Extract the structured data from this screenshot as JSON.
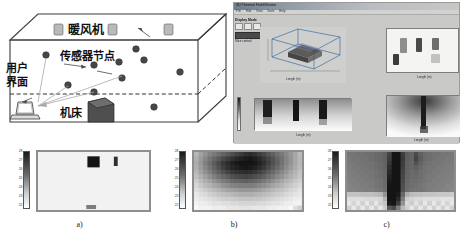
{
  "figure": {
    "panels": [
      {
        "id": "a",
        "caption": "a)"
      },
      {
        "id": "b",
        "caption": "b)"
      },
      {
        "id": "c",
        "caption": "c)"
      }
    ]
  },
  "room_diagram": {
    "labels": {
      "heater": "暖风机",
      "sensor_node": "传感器节点",
      "user_interface_line1": "用户",
      "user_interface_line2": "界面",
      "machine_tool": "机床"
    },
    "counts": {
      "heaters": 3,
      "sensor_nodes": 10,
      "machine_tools": 1,
      "user_interfaces": 1
    },
    "colors": {
      "outline": "#3a3a3a",
      "heater_fill": "#b9b9b9",
      "sensor_fill": "#4a4a4a",
      "machine_fill": "#4f4f4f"
    }
  },
  "app_window": {
    "title": "3D Thermal Field Monitor",
    "menu": [
      "File",
      "Edit",
      "View",
      "Tools",
      "Help"
    ],
    "control_panel": {
      "heading": "Display Mode",
      "boxes": [
        "X",
        "Y",
        "Z"
      ],
      "button_label": "Start monitor",
      "caption": "Slice control"
    },
    "plots": [
      {
        "name": "3d-volume-plot",
        "xlabel": "Length (m)",
        "ylabel": "Height",
        "note": "3D"
      },
      {
        "name": "top-view-plot",
        "xlabel": "Length (m)",
        "ylabel": "Width"
      },
      {
        "name": "strip-view-plot",
        "xlabel": "Length (m)"
      },
      {
        "name": "section-view-plot",
        "xlabel": "Length (m)"
      }
    ]
  },
  "chart_data": [
    {
      "type": "heatmap",
      "panel": "a",
      "title": "",
      "caption": "a)",
      "xlabel": "",
      "ylabel": "",
      "colorbar": {
        "ticks": [
          "28",
          "27",
          "26",
          "25",
          "24",
          "23",
          "22"
        ],
        "low_color": "#ffffff",
        "high_color": "#1a1a1a",
        "orientation": "vertical"
      },
      "grid": false,
      "nx": 24,
      "ny": 13,
      "description": "Near-uniform low field with two dark hot spots",
      "hotspots": [
        {
          "cx": 0.5,
          "cy": 0.17,
          "w": 0.11,
          "h": 0.19,
          "v": 28.0
        },
        {
          "cx": 0.7,
          "cy": 0.16,
          "w": 0.035,
          "h": 0.16,
          "v": 27.2
        },
        {
          "cx": 0.48,
          "cy": 0.95,
          "w": 0.09,
          "h": 0.07,
          "v": 25.0
        }
      ],
      "background_value": 22.2
    },
    {
      "type": "heatmap",
      "panel": "b",
      "title": "",
      "caption": "b)",
      "xlabel": "",
      "ylabel": "",
      "colorbar": {
        "ticks": [
          "28",
          "27",
          "26",
          "25",
          "24",
          "23",
          "22"
        ],
        "low_color": "#ffffff",
        "high_color": "#1a1a1a",
        "orientation": "vertical"
      },
      "grid": false,
      "nx": 24,
      "ny": 13,
      "description": "Pixelated diffuse plume, dark at top-centre fading to light at edges and bottom",
      "values": [
        [
          23.5,
          24.0,
          24.4,
          24.8,
          25.1,
          25.4,
          25.7,
          26.0,
          26.3,
          26.6,
          26.9,
          27.2,
          27.3,
          27.1,
          26.8,
          26.5,
          26.1,
          25.8,
          25.4,
          25.1,
          24.7,
          24.3,
          23.9,
          23.4
        ],
        [
          23.7,
          24.2,
          24.7,
          25.2,
          25.6,
          26.0,
          26.4,
          26.8,
          27.1,
          27.4,
          27.6,
          27.8,
          27.9,
          27.7,
          27.4,
          27.0,
          26.6,
          26.2,
          25.7,
          25.3,
          24.8,
          24.4,
          23.9,
          23.5
        ],
        [
          23.8,
          24.3,
          24.9,
          25.4,
          25.9,
          26.4,
          26.9,
          27.3,
          27.6,
          27.9,
          28.0,
          28.1,
          28.1,
          27.9,
          27.6,
          27.2,
          26.7,
          26.2,
          25.8,
          25.3,
          24.8,
          24.4,
          23.9,
          23.5
        ],
        [
          23.7,
          24.2,
          24.7,
          25.2,
          25.7,
          26.2,
          26.7,
          27.1,
          27.4,
          27.6,
          27.8,
          27.9,
          27.8,
          27.6,
          27.3,
          26.9,
          26.4,
          26.0,
          25.5,
          25.1,
          24.6,
          24.2,
          23.8,
          23.4
        ],
        [
          23.5,
          24.0,
          24.5,
          24.9,
          25.4,
          25.8,
          26.2,
          26.6,
          26.9,
          27.1,
          27.2,
          27.3,
          27.2,
          27.0,
          26.7,
          26.3,
          25.9,
          25.5,
          25.1,
          24.7,
          24.3,
          23.9,
          23.6,
          23.2
        ],
        [
          23.3,
          23.7,
          24.1,
          24.5,
          24.9,
          25.3,
          25.6,
          25.9,
          26.2,
          26.4,
          26.5,
          26.6,
          26.5,
          26.3,
          26.1,
          25.8,
          25.4,
          25.1,
          24.7,
          24.4,
          24.0,
          23.7,
          23.4,
          23.1
        ],
        [
          23.0,
          23.4,
          23.7,
          24.0,
          24.4,
          24.7,
          25.0,
          25.2,
          25.5,
          25.6,
          25.7,
          25.8,
          25.7,
          25.6,
          25.4,
          25.1,
          24.8,
          24.5,
          24.2,
          23.9,
          23.6,
          23.4,
          23.1,
          22.9
        ],
        [
          22.8,
          23.1,
          23.4,
          23.6,
          23.9,
          24.1,
          24.4,
          24.6,
          24.8,
          24.9,
          25.0,
          25.0,
          25.0,
          24.9,
          24.7,
          24.5,
          24.3,
          24.0,
          23.8,
          23.6,
          23.3,
          23.1,
          22.9,
          22.7
        ],
        [
          22.6,
          22.8,
          23.0,
          23.2,
          23.4,
          23.6,
          23.8,
          24.0,
          24.1,
          24.2,
          24.3,
          24.3,
          24.3,
          24.2,
          24.1,
          23.9,
          23.7,
          23.5,
          23.3,
          23.2,
          23.0,
          22.8,
          22.7,
          22.5
        ],
        [
          22.4,
          22.6,
          22.7,
          22.9,
          23.0,
          23.2,
          23.3,
          23.4,
          23.5,
          23.6,
          23.7,
          23.7,
          23.7,
          23.6,
          23.5,
          23.4,
          23.3,
          23.1,
          23.0,
          22.9,
          22.7,
          22.6,
          22.5,
          22.4
        ],
        [
          22.3,
          22.4,
          22.5,
          22.6,
          22.7,
          22.8,
          22.9,
          23.0,
          23.0,
          23.1,
          23.2,
          23.2,
          23.2,
          23.1,
          23.1,
          23.0,
          22.9,
          22.8,
          22.7,
          22.6,
          22.5,
          22.4,
          22.3,
          22.3
        ],
        [
          22.2,
          22.3,
          22.3,
          22.4,
          22.5,
          22.5,
          22.6,
          22.6,
          22.7,
          22.7,
          22.8,
          22.8,
          22.8,
          22.8,
          22.7,
          22.7,
          22.6,
          22.5,
          22.5,
          22.4,
          22.3,
          22.3,
          22.2,
          22.2
        ],
        [
          22.1,
          22.2,
          22.2,
          22.2,
          22.3,
          22.3,
          22.3,
          22.4,
          22.4,
          22.4,
          22.5,
          22.5,
          22.5,
          22.4,
          22.4,
          22.4,
          22.3,
          22.3,
          22.2,
          22.2,
          22.2,
          22.1,
          22.6,
          22.9
        ]
      ]
    },
    {
      "type": "heatmap",
      "panel": "c",
      "title": "",
      "caption": "c)",
      "xlabel": "",
      "ylabel": "",
      "colorbar": {
        "ticks": [
          "28",
          "27",
          "26",
          "25",
          "24",
          "23",
          "22"
        ],
        "low_color": "#ffffff",
        "high_color": "#1a1a1a",
        "orientation": "vertical"
      },
      "grid": false,
      "nx": 24,
      "ny": 13,
      "description": "Mid-grey field with a saturated black vertical plume column at centre and a light band along the bottom",
      "values": [
        [
          25.2,
          25.2,
          25.3,
          25.3,
          25.4,
          25.4,
          25.5,
          25.6,
          25.8,
          26.6,
          28.0,
          28.0,
          26.8,
          25.9,
          25.7,
          26.4,
          25.8,
          25.5,
          25.4,
          25.3,
          25.3,
          25.2,
          25.2,
          25.1
        ],
        [
          25.1,
          25.2,
          25.2,
          25.3,
          25.3,
          25.4,
          25.5,
          25.6,
          25.8,
          26.8,
          28.0,
          28.0,
          26.9,
          25.9,
          25.7,
          26.6,
          25.9,
          25.5,
          25.4,
          25.3,
          25.2,
          25.2,
          25.1,
          25.1
        ],
        [
          25.1,
          25.1,
          25.2,
          25.2,
          25.3,
          25.3,
          25.4,
          25.5,
          25.7,
          27.0,
          28.0,
          28.0,
          26.8,
          25.8,
          25.6,
          26.2,
          25.7,
          25.4,
          25.3,
          25.2,
          25.2,
          25.1,
          25.1,
          25.0
        ],
        [
          25.0,
          25.1,
          25.1,
          25.2,
          25.2,
          25.3,
          25.4,
          25.5,
          25.7,
          27.2,
          28.0,
          28.0,
          26.7,
          25.8,
          25.6,
          25.8,
          25.5,
          25.3,
          25.2,
          25.2,
          25.1,
          25.1,
          25.0,
          25.0
        ],
        [
          25.0,
          25.0,
          25.1,
          25.1,
          25.2,
          25.2,
          25.3,
          25.4,
          25.6,
          27.4,
          28.0,
          28.0,
          26.6,
          25.7,
          25.5,
          25.6,
          25.4,
          25.3,
          25.2,
          25.1,
          25.1,
          25.0,
          25.0,
          24.9
        ],
        [
          24.9,
          25.0,
          25.0,
          25.1,
          25.1,
          25.2,
          25.3,
          25.4,
          25.6,
          27.6,
          28.0,
          28.0,
          26.5,
          25.7,
          25.5,
          25.5,
          25.4,
          25.2,
          25.1,
          25.1,
          25.0,
          25.0,
          24.9,
          24.9
        ],
        [
          24.9,
          24.9,
          25.0,
          25.0,
          25.1,
          25.1,
          25.2,
          25.3,
          25.5,
          27.8,
          28.0,
          28.0,
          26.4,
          25.6,
          25.4,
          25.4,
          25.3,
          25.2,
          25.1,
          25.0,
          25.0,
          24.9,
          24.9,
          24.8
        ],
        [
          24.8,
          24.9,
          24.9,
          25.0,
          25.0,
          25.1,
          25.2,
          25.3,
          25.5,
          27.9,
          28.0,
          28.0,
          26.3,
          25.5,
          25.4,
          25.3,
          25.2,
          25.1,
          25.0,
          25.0,
          24.9,
          24.9,
          24.8,
          24.8
        ],
        [
          24.8,
          24.8,
          24.9,
          24.9,
          25.0,
          25.0,
          25.1,
          25.2,
          25.4,
          28.0,
          28.0,
          28.0,
          26.2,
          25.5,
          25.3,
          25.2,
          25.2,
          25.1,
          25.0,
          24.9,
          24.9,
          24.8,
          24.8,
          24.7
        ],
        [
          23.2,
          23.2,
          23.2,
          23.3,
          23.3,
          23.3,
          23.4,
          23.5,
          24.4,
          28.0,
          28.0,
          27.8,
          25.6,
          23.8,
          23.4,
          23.3,
          23.3,
          23.2,
          23.2,
          23.2,
          23.1,
          23.1,
          23.1,
          23.0
        ],
        [
          22.6,
          22.6,
          22.6,
          22.6,
          22.7,
          22.7,
          22.7,
          22.8,
          23.6,
          28.0,
          28.0,
          27.4,
          25.0,
          23.0,
          22.8,
          22.7,
          22.7,
          22.6,
          22.6,
          22.6,
          22.6,
          22.5,
          22.5,
          22.5
        ],
        [
          22.4,
          22.8,
          22.4,
          22.9,
          22.4,
          22.9,
          22.4,
          22.9,
          23.2,
          27.8,
          28.0,
          26.8,
          24.4,
          22.7,
          23.0,
          22.5,
          22.9,
          22.4,
          22.9,
          22.4,
          22.9,
          22.4,
          22.8,
          22.4
        ],
        [
          22.9,
          22.4,
          22.9,
          22.4,
          22.9,
          22.4,
          22.9,
          22.4,
          23.0,
          26.0,
          26.4,
          25.0,
          23.4,
          22.9,
          22.4,
          22.9,
          22.4,
          22.9,
          22.4,
          22.9,
          22.4,
          22.9,
          22.4,
          22.9
        ]
      ]
    }
  ]
}
